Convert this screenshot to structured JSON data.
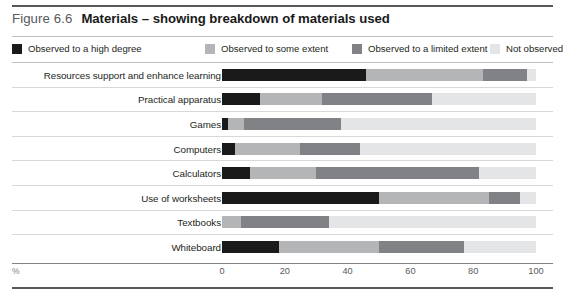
{
  "figure": {
    "number": "Figure 6.6",
    "title": "Materials – showing breakdown of materials used"
  },
  "legend": {
    "items": [
      {
        "label": "Observed to a high degree",
        "color": "#1a1a1a",
        "left": 0
      },
      {
        "label": "Observed to some extent",
        "color": "#b4b5b7",
        "left": 193
      },
      {
        "label": "Observed to a limited extent",
        "color": "#808285",
        "left": 340
      },
      {
        "label": "Not observed",
        "color": "#e4e5e6",
        "left": 478
      }
    ]
  },
  "axis": {
    "percent_symbol": "%",
    "ticks": [
      "0",
      "20",
      "40",
      "60",
      "80",
      "100"
    ]
  },
  "chart_data": {
    "type": "bar",
    "title": "Materials – showing breakdown of materials used",
    "xlabel": "%",
    "ylabel": "",
    "xlim": [
      0,
      100
    ],
    "stacked": true,
    "orientation": "horizontal",
    "grid": false,
    "legend_position": "top",
    "categories": [
      "Resources support and enhance learning",
      "Practical apparatus",
      "Games",
      "Computers",
      "Calculators",
      "Use of worksheets",
      "Textbooks",
      "Whiteboard"
    ],
    "series": [
      {
        "name": "Observed to a high degree",
        "color": "#1a1a1a",
        "values": [
          46,
          12,
          2,
          4,
          9,
          50,
          0,
          18
        ]
      },
      {
        "name": "Observed to some extent",
        "color": "#b4b5b7",
        "values": [
          37,
          20,
          5,
          21,
          21,
          35,
          6,
          32
        ]
      },
      {
        "name": "Observed to a limited extent",
        "color": "#808285",
        "values": [
          14,
          35,
          31,
          19,
          52,
          10,
          28,
          27
        ]
      },
      {
        "name": "Not observed",
        "color": "#e4e5e6",
        "values": [
          3,
          33,
          62,
          56,
          18,
          5,
          66,
          23
        ]
      }
    ]
  }
}
